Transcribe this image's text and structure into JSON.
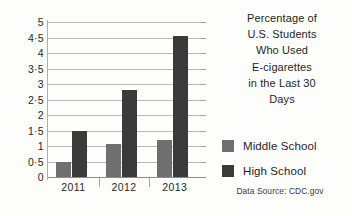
{
  "chart_data": {
    "type": "bar",
    "title_lines": [
      "Percentage of",
      "U.S. Students",
      "Who Used",
      "E-cigarettes",
      "in the Last 30",
      "Days"
    ],
    "categories": [
      "2011",
      "2012",
      "2013"
    ],
    "series": [
      {
        "name": "Middle School",
        "color": "#6f6f6f",
        "values": [
          0.5,
          1.05,
          1.2
        ]
      },
      {
        "name": "High School",
        "color": "#3a3a3a",
        "values": [
          1.5,
          2.8,
          4.55
        ]
      }
    ],
    "xlabel": "",
    "ylabel": "",
    "ylim": [
      0,
      5
    ],
    "yticks": [
      "0",
      "0.5",
      "1",
      "1.5",
      "2",
      "2.5",
      "3",
      "3.5",
      "4",
      "4.5",
      "5"
    ],
    "ytick_values": [
      0,
      0.5,
      1,
      1.5,
      2,
      2.5,
      3,
      3.5,
      4,
      4.5,
      5
    ],
    "grid": true,
    "legend_position": "right",
    "source": "Data Source: CDC.gov"
  }
}
